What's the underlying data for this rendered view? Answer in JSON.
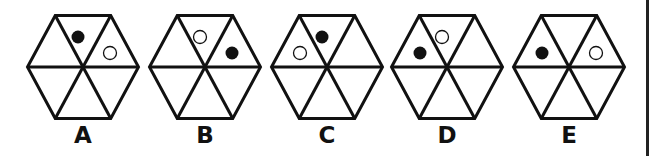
{
  "figure": {
    "type": "multiple-choice-options",
    "shape": "hexagon divided into 6 triangles",
    "colors": {
      "stroke": "#111111",
      "filled_dot": "#111111",
      "empty_dot_fill": "#ffffff",
      "background": "#ffffff"
    },
    "options": [
      {
        "label": "A",
        "cx": 83,
        "dots": [
          {
            "segment": "top",
            "fill": "black"
          },
          {
            "segment": "upper-right",
            "fill": "white"
          }
        ]
      },
      {
        "label": "B",
        "cx": 205,
        "dots": [
          {
            "segment": "top",
            "fill": "white"
          },
          {
            "segment": "upper-right",
            "fill": "black"
          }
        ]
      },
      {
        "label": "C",
        "cx": 327,
        "dots": [
          {
            "segment": "top",
            "fill": "black"
          },
          {
            "segment": "upper-left",
            "fill": "white"
          }
        ]
      },
      {
        "label": "D",
        "cx": 447,
        "dots": [
          {
            "segment": "top",
            "fill": "white"
          },
          {
            "segment": "upper-left",
            "fill": "black"
          }
        ]
      },
      {
        "label": "E",
        "cx": 569,
        "dots": [
          {
            "segment": "upper-left",
            "fill": "black"
          },
          {
            "segment": "upper-right",
            "fill": "white"
          }
        ]
      }
    ]
  }
}
